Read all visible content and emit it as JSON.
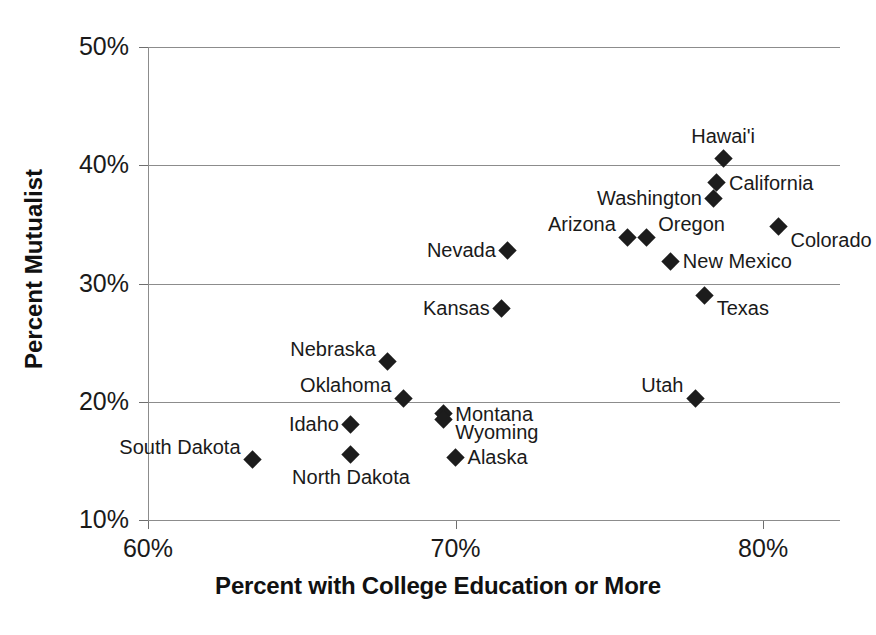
{
  "chart_data": {
    "type": "scatter",
    "title": "",
    "xlabel": "Percent with College Education or More",
    "ylabel": "Percent Mutualist",
    "xlim": [
      60,
      82.5
    ],
    "ylim": [
      10,
      50
    ],
    "xticks": [
      "60%",
      "70%",
      "80%"
    ],
    "xtick_values": [
      60,
      70,
      80
    ],
    "yticks": [
      "10%",
      "20%",
      "30%",
      "40%",
      "50%"
    ],
    "ytick_values": [
      10,
      20,
      30,
      40,
      50
    ],
    "grid": "horizontal",
    "legend": "none",
    "marker": "filled-diamond",
    "marker_color": "#1c1c1c",
    "grid_color": "#8c8c8c",
    "points": [
      {
        "label": "Hawai'i",
        "x": 78.7,
        "y": 40.6,
        "label_pos": "above"
      },
      {
        "label": "California",
        "x": 78.5,
        "y": 38.5,
        "label_pos": "right"
      },
      {
        "label": "Washington",
        "x": 78.4,
        "y": 37.2,
        "label_pos": "left"
      },
      {
        "label": "Colorado",
        "x": 80.5,
        "y": 34.8,
        "label_pos": "below-right"
      },
      {
        "label": "Arizona",
        "x": 75.6,
        "y": 33.9,
        "label_pos": "above-left"
      },
      {
        "label": "Oregon",
        "x": 76.2,
        "y": 33.9,
        "label_pos": "above-right"
      },
      {
        "label": "Nevada",
        "x": 71.7,
        "y": 32.8,
        "label_pos": "left"
      },
      {
        "label": "New Mexico",
        "x": 77.0,
        "y": 31.9,
        "label_pos": "right"
      },
      {
        "label": "Texas",
        "x": 78.1,
        "y": 29.0,
        "label_pos": "below-right"
      },
      {
        "label": "Kansas",
        "x": 71.5,
        "y": 27.9,
        "label_pos": "left"
      },
      {
        "label": "Nebraska",
        "x": 67.8,
        "y": 23.4,
        "label_pos": "above-left"
      },
      {
        "label": "Oklahoma",
        "x": 68.3,
        "y": 20.3,
        "label_pos": "above-left"
      },
      {
        "label": "Utah",
        "x": 77.8,
        "y": 20.3,
        "label_pos": "above-left"
      },
      {
        "label": "Montana",
        "x": 69.6,
        "y": 19.0,
        "label_pos": "right"
      },
      {
        "label": "Wyoming",
        "x": 69.6,
        "y": 18.5,
        "label_pos": "below-right"
      },
      {
        "label": "Idaho",
        "x": 66.6,
        "y": 18.1,
        "label_pos": "left"
      },
      {
        "label": "North Dakota",
        "x": 66.6,
        "y": 15.5,
        "label_pos": "below"
      },
      {
        "label": "Alaska",
        "x": 70.0,
        "y": 15.3,
        "label_pos": "right"
      },
      {
        "label": "South Dakota",
        "x": 63.4,
        "y": 15.1,
        "label_pos": "above-left"
      }
    ]
  }
}
